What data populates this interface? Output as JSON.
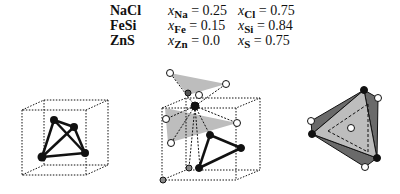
{
  "compounds": [
    {
      "name": "NaCl",
      "a_sym": "Na",
      "a_val": "0.25",
      "b_sym": "Cl",
      "b_val": "0.75"
    },
    {
      "name": "FeSi",
      "a_sym": "Fe",
      "a_val": "0.15",
      "b_sym": "Si",
      "b_val": "0.84"
    },
    {
      "name": "ZnS",
      "a_sym": "Zn",
      "a_val": "0.0",
      "b_sym": "S",
      "b_val": "0.75"
    }
  ],
  "labels": {
    "x_var": "x",
    "equals": " = "
  },
  "colors": {
    "ink": "#111111",
    "face_light": "#bdbdbd",
    "face_dark": "#6a6a6a",
    "open_atom": "#ffffff",
    "grey_atom": "#8a8a8a"
  },
  "figures": [
    "cube-with-tetrahedron",
    "cube-with-coordination-polyhedra",
    "tetrahedron-polyhedron"
  ]
}
